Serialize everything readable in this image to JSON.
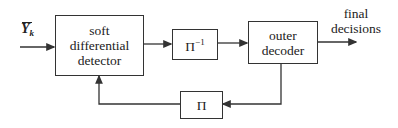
{
  "diagram": {
    "input": {
      "symbol": "Y",
      "subscript": "k",
      "overbar": true
    },
    "blocks": {
      "detector": {
        "line1": "soft",
        "line2": "differential",
        "line3": "detector"
      },
      "deinterleaver": {
        "symbol": "Π",
        "exponent": "−1"
      },
      "decoder": {
        "line1": "outer",
        "line2": "decoder"
      },
      "interleaver": {
        "symbol": "Π"
      }
    },
    "output": {
      "line1": "final",
      "line2": "decisions"
    },
    "edges": [
      {
        "from": "input",
        "to": "detector"
      },
      {
        "from": "detector",
        "to": "deinterleaver"
      },
      {
        "from": "deinterleaver",
        "to": "decoder"
      },
      {
        "from": "decoder",
        "to": "output"
      },
      {
        "from": "decoder",
        "to": "interleaver"
      },
      {
        "from": "interleaver",
        "to": "detector"
      }
    ],
    "colors": {
      "line": "#333333",
      "background": "#ffffff"
    }
  }
}
